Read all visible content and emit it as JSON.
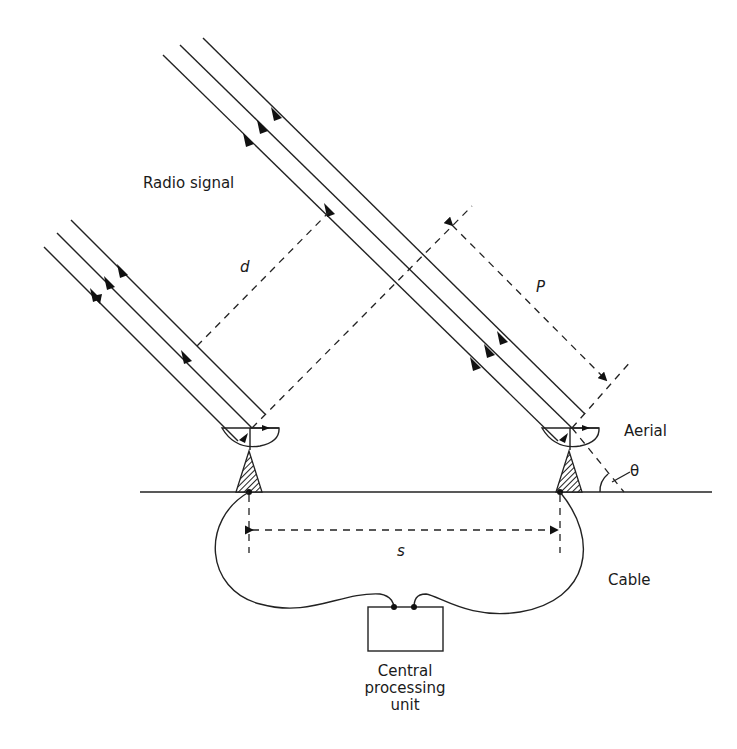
{
  "diagram": {
    "labels": {
      "radio_signal": "Radio signal",
      "d": "d",
      "p": "P",
      "aerial": "Aerial",
      "theta": "θ",
      "s": "s",
      "cable": "Cable",
      "cpu_line1": "Central",
      "cpu_line2": "processing",
      "cpu_line3": "unit"
    },
    "components": [
      {
        "id": "left-aerial",
        "type": "dish-on-mount",
        "position": "left"
      },
      {
        "id": "right-aerial",
        "type": "dish-on-mount",
        "position": "right"
      },
      {
        "id": "central-processing-unit",
        "type": "box"
      },
      {
        "id": "ground",
        "type": "line"
      },
      {
        "id": "cable",
        "type": "curve"
      }
    ],
    "edges": [
      {
        "from": "left-aerial",
        "to": "central-processing-unit",
        "label": "Cable"
      },
      {
        "from": "right-aerial",
        "to": "central-processing-unit",
        "label": "Cable"
      }
    ],
    "dimensions": [
      {
        "name": "d",
        "meaning": "path difference between wavefronts"
      },
      {
        "name": "P",
        "meaning": "wavefront separation"
      },
      {
        "name": "s",
        "meaning": "baseline between aerials"
      },
      {
        "name": "θ",
        "meaning": "elevation angle of signal"
      }
    ]
  }
}
